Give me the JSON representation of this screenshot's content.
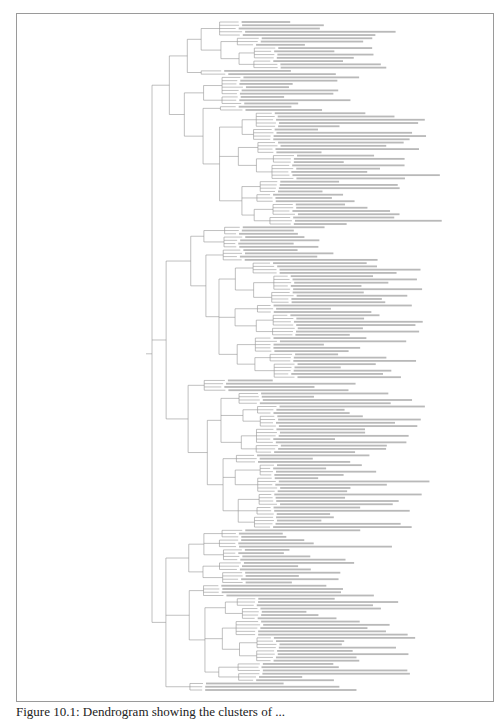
{
  "figure": {
    "type": "dendrogram",
    "orientation": "root-left, leaves-right",
    "caption": "Figure 10.1: Dendrogram showing the clusters of ...",
    "caption_note": "caption is cropped at the bottom edge of the screenshot",
    "leaf_labels_legible": false,
    "line_color": "#8c8c8c",
    "frame_color": "#9a9a9a"
  },
  "tree": {
    "children": [
      {
        "children": [
          {
            "children": [
              {
                "children": [
                  {
                    "leaves": 5
                  },
                  {
                    "children": [
                      {
                        "leaves": 3
                      },
                      {
                        "children": [
                          {
                            "leaves": 4
                          },
                          {
                            "leaves": 3
                          }
                        ]
                      }
                    ]
                  }
                ]
              },
              {
                "leaves": 2
              }
            ]
          },
          {
            "children": [
              {
                "children": [
                  {
                    "leaves": 6
                  },
                  {
                    "leaves": 3
                  }
                ]
              },
              {
                "children": [
                  {
                    "leaves": 2
                  },
                  {
                    "children": [
                      {
                        "children": [
                          {
                            "leaves": 5
                          },
                          {
                            "leaves": 4
                          }
                        ]
                      },
                      {
                        "children": [
                          {
                            "leaves": 4
                          },
                          {
                            "children": [
                              {
                                "leaves": 3
                              },
                              {
                                "leaves": 5
                              }
                            ]
                          }
                        ]
                      },
                      {
                        "children": [
                          {
                            "leaves": 4
                          },
                          {
                            "leaves": 3
                          },
                          {
                            "children": [
                              {
                                "leaves": 4
                              },
                              {
                                "leaves": 3
                              }
                            ]
                          }
                        ]
                      }
                    ]
                  }
                ]
              }
            ]
          }
        ]
      },
      {
        "children": [
          {
            "children": [
              {
                "children": [
                  {
                    "leaves": 3
                  },
                  {
                    "leaves": 4
                  }
                ]
              },
              {
                "children": [
                  {
                    "leaves": 4
                  },
                  {
                    "children": [
                      {
                        "children": [
                          {
                            "leaves": 4
                          },
                          {
                            "children": [
                              {
                                "leaves": 5
                              },
                              {
                                "leaves": 4
                              }
                            ]
                          }
                        ]
                      },
                      {
                        "children": [
                          {
                            "leaves": 3
                          },
                          {
                            "children": [
                              {
                                "leaves": 4
                              },
                              {
                                "leaves": 3
                              }
                            ]
                          }
                        ]
                      },
                      {
                        "children": [
                          {
                            "leaves": 5
                          },
                          {
                            "children": [
                              {
                                "leaves": 3
                              },
                              {
                                "leaves": 5
                              }
                            ]
                          }
                        ]
                      }
                    ]
                  }
                ]
              }
            ]
          },
          {
            "children": [
              {
                "leaves": 4
              },
              {
                "children": [
                  {
                    "children": [
                      {
                        "leaves": 4
                      },
                      {
                        "children": [
                          {
                            "leaves": 3
                          },
                          {
                            "leaves": 4
                          }
                        ]
                      },
                      {
                        "children": [
                          {
                            "leaves": 5
                          },
                          {
                            "leaves": 3
                          }
                        ]
                      }
                    ]
                  },
                  {
                    "children": [
                      {
                        "leaves": 3
                      },
                      {
                        "children": [
                          {
                            "leaves": 4
                          },
                          {
                            "leaves": 5
                          }
                        ]
                      },
                      {
                        "children": [
                          {
                            "leaves": 4
                          },
                          {
                            "leaves": 3
                          },
                          {
                            "leaves": 4
                          }
                        ]
                      }
                    ]
                  }
                ]
              }
            ]
          }
        ]
      },
      {
        "children": [
          {
            "children": [
              {
                "children": [
                  {
                    "leaves": 3
                  },
                  {
                    "leaves": 3
                  },
                  {
                    "leaves": 4
                  }
                ]
              },
              {
                "children": [
                  {
                    "leaves": 3
                  },
                  {
                    "leaves": 4
                  }
                ]
              }
            ]
          },
          {
            "children": [
              {
                "leaves": 4
              },
              {
                "children": [
                  {
                    "children": [
                      {
                        "leaves": 3
                      },
                      {
                        "leaves": 4
                      }
                    ]
                  },
                  {
                    "children": [
                      {
                        "leaves": 5
                      },
                      {
                        "children": [
                          {
                            "leaves": 4
                          },
                          {
                            "leaves": 4
                          }
                        ]
                      }
                    ]
                  },
                  {
                    "children": [
                      {
                        "leaves": 3
                      },
                      {
                        "leaves": 3
                      }
                    ]
                  }
                ]
              }
            ]
          },
          {
            "leaves": 3
          }
        ]
      }
    ]
  }
}
